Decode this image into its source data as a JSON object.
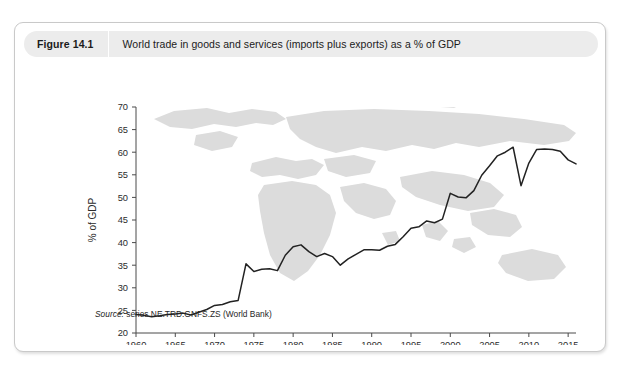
{
  "figure": {
    "number": "Figure 14.1",
    "title": "World trade in goods and services (imports plus exports) as a % of GDP",
    "source_label": "Source:",
    "source_text": " series NE.TRD.GNFS.ZS  (World Bank)"
  },
  "colors": {
    "card_border": "#c9c9c9",
    "header_band": "#ececec",
    "line": "#222222",
    "axis": "#4a4a4a",
    "map_watermark": "#dcdcdc",
    "text": "#1b1b1b"
  },
  "chart_data": {
    "type": "line",
    "title": "World trade in goods and services (imports plus exports) as a % of GDP",
    "xlabel": "",
    "ylabel": "% of GDP",
    "xlim": [
      1960,
      2016
    ],
    "ylim": [
      20,
      70
    ],
    "ytick_values": [
      20,
      25,
      30,
      35,
      40,
      45,
      50,
      55,
      60,
      65,
      70
    ],
    "ytick_labels": [
      "20",
      "25",
      "30",
      "35",
      "40",
      "45",
      "50",
      "55",
      "60",
      "65",
      "70"
    ],
    "xtick_values": [
      1960,
      1965,
      1970,
      1975,
      1980,
      1985,
      1990,
      1995,
      2000,
      2005,
      2010,
      2015
    ],
    "xtick_labels": [
      "1960",
      "1965",
      "1970",
      "1975",
      "1980",
      "1985",
      "1990",
      "1995",
      "2000",
      "2005",
      "2010",
      "2015"
    ],
    "grid": false,
    "legend": false,
    "series": [
      {
        "name": "World trade (% of GDP)",
        "x": [
          1960,
          1961,
          1962,
          1963,
          1964,
          1965,
          1966,
          1967,
          1968,
          1969,
          1970,
          1971,
          1972,
          1973,
          1974,
          1975,
          1976,
          1977,
          1978,
          1979,
          1980,
          1981,
          1982,
          1983,
          1984,
          1985,
          1986,
          1987,
          1988,
          1989,
          1990,
          1991,
          1992,
          1993,
          1994,
          1995,
          1996,
          1997,
          1998,
          1999,
          2000,
          2001,
          2002,
          2003,
          2004,
          2005,
          2006,
          2007,
          2008,
          2009,
          2010,
          2011,
          2012,
          2013,
          2014,
          2015,
          2016
        ],
        "values": [
          24.1,
          23.9,
          23.6,
          23.8,
          24.1,
          24.2,
          24.4,
          24.0,
          24.6,
          25.2,
          26.1,
          26.3,
          26.9,
          27.2,
          35.3,
          33.6,
          34.1,
          34.2,
          33.8,
          37.2,
          39.1,
          39.5,
          38.0,
          36.9,
          37.6,
          36.9,
          35.0,
          36.4,
          37.4,
          38.4,
          38.4,
          38.3,
          39.2,
          39.6,
          41.3,
          43.2,
          43.5,
          44.8,
          44.4,
          45.2,
          50.9,
          50.1,
          49.9,
          51.5,
          54.9,
          57.0,
          59.2,
          60.0,
          61.1,
          52.6,
          57.6,
          60.6,
          60.7,
          60.6,
          60.2,
          58.3,
          57.4
        ]
      }
    ],
    "annotations": [
      {
        "label": "1974 oil-shock jump",
        "x": 1974,
        "y": 35.3
      },
      {
        "label": "Pre-crisis peak",
        "x": 2008,
        "y": 61.1
      },
      {
        "label": "Global financial crisis trough",
        "x": 2009,
        "y": 52.6
      }
    ]
  }
}
